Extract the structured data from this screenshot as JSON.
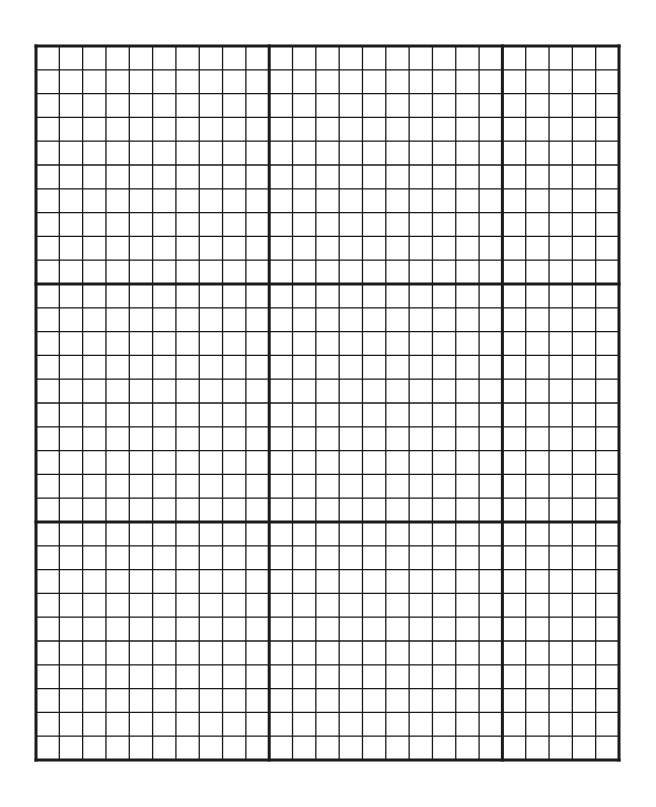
{
  "grid": {
    "left": 36,
    "top": 46,
    "right": 619,
    "bottom": 760,
    "columns": 25,
    "rows": 30,
    "major_column_lines": [
      0,
      10,
      20,
      25
    ],
    "major_row_lines": [
      0,
      10,
      20,
      30
    ],
    "line_color": "#1a1a1a",
    "minor_width": 1.3,
    "major_width": 3,
    "background": "#ffffff"
  }
}
